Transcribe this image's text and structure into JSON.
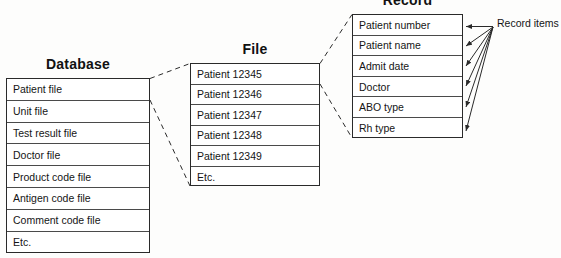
{
  "diagram": {
    "type": "hierarchical-data-structure",
    "line_color": "#2a2a2a",
    "background_color": "#fdfdfc",
    "text_color": "#151515"
  },
  "database": {
    "title": "Database",
    "rows": [
      "Patient file",
      "Unit file",
      "Test result file",
      "Doctor file",
      "Product code file",
      "Antigen code file",
      "Comment code file",
      "Etc."
    ]
  },
  "file": {
    "title": "File",
    "rows": [
      "Patient 12345",
      "Patient 12346",
      "Patient 12347",
      "Patient 12348",
      "Patient 12349",
      "Etc."
    ]
  },
  "record": {
    "title": "Record",
    "rows": [
      "Patient number",
      "Patient name",
      "Admit date",
      "Doctor",
      "ABO type",
      "Rh type"
    ]
  },
  "annotations": {
    "record_items_label": "Record items"
  }
}
